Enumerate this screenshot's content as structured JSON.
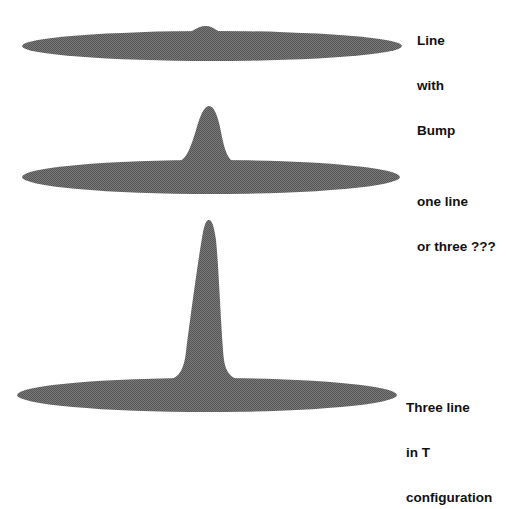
{
  "diagram": {
    "fill_color": "#6b6b6b",
    "background": "#ffffff",
    "shapes": [
      {
        "name": "line-with-bump",
        "label_lines": [
          "Line",
          "with",
          "Bump"
        ],
        "ellipse": {
          "cx": 212,
          "cy": 46,
          "rx": 190,
          "ry": 15
        },
        "peak": {
          "x": 206,
          "y": 26
        }
      },
      {
        "name": "one-line-or-three",
        "label_lines": [
          "one line",
          "or three ???"
        ],
        "ellipse": {
          "cx": 211,
          "cy": 177,
          "rx": 189,
          "ry": 17
        },
        "peak": {
          "x": 209,
          "y": 106
        }
      },
      {
        "name": "three-line-t-configuration",
        "label_lines": [
          "Three line",
          "in T",
          "configuration"
        ],
        "ellipse": {
          "cx": 207,
          "cy": 395,
          "rx": 190,
          "ry": 17
        },
        "peak": {
          "x": 209,
          "y": 220
        }
      }
    ]
  }
}
